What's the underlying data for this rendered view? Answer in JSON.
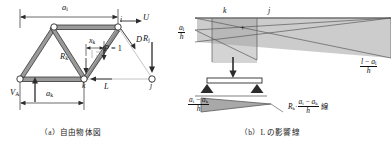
{
  "figure": {
    "kind": "engineering-diagram",
    "stroke_color": "#2b2b2b",
    "member_fill": "#9a9a9a",
    "shade_fill": "#b8b8b8",
    "light_line": "#b5b5b5"
  },
  "panel_a": {
    "caption": "（a）自由物体図",
    "dimensions": [
      {
        "name": "a_i",
        "base": "a",
        "sub": "i"
      },
      {
        "name": "a_k",
        "base": "a",
        "sub": "k"
      }
    ],
    "nodes": [
      {
        "id": "i",
        "label": "i"
      },
      {
        "id": "k",
        "label": "k"
      },
      {
        "id": "j",
        "label": "j"
      }
    ],
    "forces": [
      {
        "name": "U",
        "label": "U"
      },
      {
        "name": "D",
        "label": "D"
      },
      {
        "name": "L",
        "label": "L"
      },
      {
        "name": "R_k",
        "base": "R",
        "sub": "k"
      },
      {
        "name": "R_j",
        "base": "R",
        "sub": "j"
      },
      {
        "name": "V_A",
        "base": "V",
        "sub": "A"
      }
    ],
    "load": {
      "label": "P = 1",
      "offset_base": "x",
      "offset_sub": "k"
    }
  },
  "panel_b": {
    "caption": "（b）L の影響線",
    "node_marks": [
      {
        "label": "k"
      },
      {
        "label": "j"
      }
    ],
    "plus_sign": "+",
    "left_ordinate": {
      "num_base": "a",
      "num_sub": "i",
      "den": "h"
    },
    "right_ordinate": {
      "num": "l − a",
      "num_sub": "i",
      "den": "h"
    },
    "small_ordinate": {
      "num": "a",
      "num_sub1": "i",
      "minus": "−",
      "num2": "a",
      "num_sub2": "k",
      "den": "h"
    },
    "annotation": {
      "factor_base": "R",
      "factor_sub": "k",
      "dot": "·",
      "num": "a",
      "num_sub1": "i",
      "minus": "−",
      "num2": "a",
      "num_sub2": "k",
      "den": "h",
      "suffix": "線"
    },
    "beam": {
      "load_arrow": "down-arrow",
      "supports": 2
    }
  }
}
